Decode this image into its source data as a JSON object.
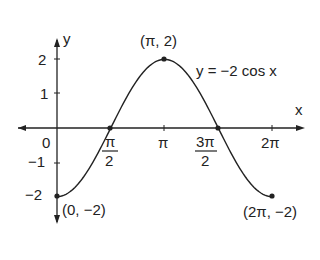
{
  "chart_data": {
    "type": "line",
    "title": "",
    "equation": "y = −2 cos x",
    "xlabel": "x",
    "ylabel": "y",
    "xlim": [
      0,
      6.2832
    ],
    "ylim": [
      -2,
      2
    ],
    "x_ticks": [
      "0",
      "π/2",
      "π",
      "3π/2",
      "2π"
    ],
    "y_ticks": [
      "2",
      "1",
      "0",
      "−1",
      "−2"
    ],
    "series": [
      {
        "name": "y = −2 cos x",
        "x": [
          0,
          1.5708,
          3.1416,
          4.7124,
          6.2832
        ],
        "y": [
          -2,
          0,
          2,
          0,
          -2
        ]
      }
    ],
    "annotations": [
      {
        "text": "(π, 2)",
        "x": 3.1416,
        "y": 2
      },
      {
        "text": "(0, −2)",
        "x": 0,
        "y": -2
      },
      {
        "text": "(2π, −2)",
        "x": 6.2832,
        "y": -2
      }
    ],
    "grid": false,
    "legend": "none"
  },
  "labels": {
    "y_axis": "y",
    "x_axis": "x",
    "equation": "y = −2 cos x",
    "peak": "(π, 2)",
    "start": "(0, −2)",
    "end": "(2π, −2)",
    "origin": "0",
    "y2": "2",
    "y1": "1",
    "ym1": "−1",
    "ym2": "−2",
    "pi_num": "π",
    "two": "2",
    "pi": "π",
    "three_pi": "3π",
    "two_pi": "2π"
  }
}
